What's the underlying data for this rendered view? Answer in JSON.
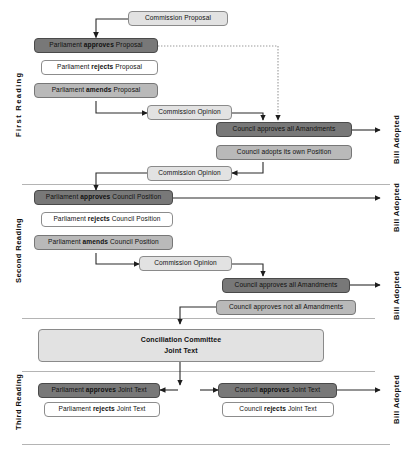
{
  "diagram": {
    "section_labels": [
      {
        "id": "first-reading",
        "text": "First  Reading"
      },
      {
        "id": "second-reading",
        "text": "Second Reading"
      },
      {
        "id": "third-reading",
        "text": "Third Reading"
      }
    ],
    "outcome_labels": [
      {
        "id": "bill-adopted-1",
        "text": "Bill Adopted"
      },
      {
        "id": "bill-adopted-2",
        "text": "Bill Adopted"
      },
      {
        "id": "bill-adopted-3",
        "text": "Bill Adopted"
      },
      {
        "id": "bill-adopted-4",
        "text": "Bill Adopted"
      }
    ],
    "nodes": [
      {
        "id": "commission-proposal",
        "text": "Commission Proposal",
        "shade": "light"
      },
      {
        "id": "parliament-approves-proposal",
        "prefix": "Parliament ",
        "strong": "approves",
        "suffix": " Proposal",
        "shade": "dark"
      },
      {
        "id": "parliament-rejects-proposal",
        "prefix": "Parliament ",
        "strong": "rejects",
        "suffix": " Proposal",
        "shade": "white"
      },
      {
        "id": "parliament-amends-proposal",
        "prefix": "Parliament ",
        "strong": "amends",
        "suffix": " Proposal",
        "shade": "mid"
      },
      {
        "id": "commission-opinion-1",
        "text": "Commission Opinion",
        "shade": "light"
      },
      {
        "id": "council-approves-all-amendments-1",
        "text": "Council approves all Amandments",
        "shade": "dark"
      },
      {
        "id": "council-adopts-own-position",
        "text": "Council adopts its own Position",
        "shade": "mid"
      },
      {
        "id": "commission-opinion-2",
        "text": "Commission Opinion",
        "shade": "light"
      },
      {
        "id": "parliament-approves-council-position",
        "prefix": "Parliament ",
        "strong": "approves",
        "suffix": " Council Position",
        "shade": "dark"
      },
      {
        "id": "parliament-rejects-council-position",
        "prefix": "Parliament ",
        "strong": "rejects",
        "suffix": " Council Position",
        "shade": "white"
      },
      {
        "id": "parliament-amends-council-position",
        "prefix": "Parliament ",
        "strong": "amends",
        "suffix": " Council Position",
        "shade": "mid"
      },
      {
        "id": "commission-opinion-3",
        "text": "Commission Opinion",
        "shade": "light"
      },
      {
        "id": "council-approves-all-amendments-2",
        "text": "Council approves all Amandments",
        "shade": "dark"
      },
      {
        "id": "council-approves-not-all-amendments",
        "text": "Council approves not all Amandments",
        "shade": "mid"
      },
      {
        "id": "conciliation-committee",
        "line1": "Conciliation Committee",
        "line2": "Joint Text",
        "shade": "light"
      },
      {
        "id": "parliament-approves-joint-text",
        "prefix": "Parliament ",
        "strong": "approves",
        "suffix": " Joint Text",
        "shade": "dark"
      },
      {
        "id": "parliament-rejects-joint-text",
        "prefix": "Parliament ",
        "strong": "rejects",
        "suffix": " Joint Text",
        "shade": "white"
      },
      {
        "id": "council-approves-joint-text",
        "prefix": "Council ",
        "strong": "approves",
        "suffix": " Joint Text",
        "shade": "dark"
      },
      {
        "id": "council-rejects-joint-text",
        "prefix": "Council ",
        "strong": "rejects",
        "suffix": " Joint Text",
        "shade": "white"
      }
    ],
    "colors": {
      "dark": "#787878",
      "mid": "#b9b9b9",
      "light": "#e2e2e2",
      "white": "#ffffff",
      "stroke": "#4a4a4a",
      "divider": "#b4b4b4"
    }
  }
}
